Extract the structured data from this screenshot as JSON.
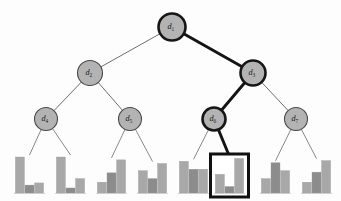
{
  "figure": {
    "type": "hierarchical-tree-with-leaf-histograms",
    "background_color": "#fdfdfd",
    "node_fill_color": "#b3b3b3",
    "node_stroke_color": "#4a4a4a",
    "highlight_color": "#141414",
    "bar_color": "#a8a8a8",
    "bar_color_dark": "#8c8c8c",
    "highlight_path": [
      "d1",
      "d3",
      "d6",
      "histogram-6"
    ]
  },
  "nodes": [
    {
      "id": "d1",
      "label": "d",
      "subscript": "1",
      "cx": 172,
      "cy": 27,
      "r": 13.5,
      "highlighted": true,
      "level": 0
    },
    {
      "id": "d2",
      "label": "d",
      "subscript": "2",
      "cx": 90,
      "cy": 73,
      "r": 12.5,
      "highlighted": false,
      "level": 1
    },
    {
      "id": "d3",
      "label": "d",
      "subscript": "3",
      "cx": 253,
      "cy": 73,
      "r": 12.5,
      "highlighted": true,
      "level": 1
    },
    {
      "id": "d4",
      "label": "d",
      "subscript": "4",
      "cx": 46,
      "cy": 119,
      "r": 11.5,
      "highlighted": false,
      "level": 2
    },
    {
      "id": "d5",
      "label": "d",
      "subscript": "5",
      "cx": 130,
      "cy": 119,
      "r": 11.5,
      "highlighted": false,
      "level": 2
    },
    {
      "id": "d6",
      "label": "d",
      "subscript": "6",
      "cx": 214,
      "cy": 119,
      "r": 11.5,
      "highlighted": true,
      "level": 2
    },
    {
      "id": "d7",
      "label": "d",
      "subscript": "7",
      "cx": 296,
      "cy": 119,
      "r": 11.5,
      "highlighted": false,
      "level": 2
    }
  ],
  "edges": [
    {
      "id": "e-d1-d2",
      "from": "d1",
      "to": "d2",
      "highlighted": false
    },
    {
      "id": "e-d1-d3",
      "from": "d1",
      "to": "d3",
      "highlighted": true
    },
    {
      "id": "e-d2-d4",
      "from": "d2",
      "to": "d4",
      "highlighted": false
    },
    {
      "id": "e-d2-d5",
      "from": "d2",
      "to": "d5",
      "highlighted": false
    },
    {
      "id": "e-d3-d6",
      "from": "d3",
      "to": "d6",
      "highlighted": true
    },
    {
      "id": "e-d3-d7",
      "from": "d3",
      "to": "d7",
      "highlighted": false
    }
  ],
  "leaf_edges": [
    {
      "id": "le-d4-h1",
      "from": "d4",
      "to": "histogram-1",
      "highlighted": false
    },
    {
      "id": "le-d4-h2",
      "from": "d4",
      "to": "histogram-2",
      "highlighted": false
    },
    {
      "id": "le-d5-h3",
      "from": "d5",
      "to": "histogram-3",
      "highlighted": false
    },
    {
      "id": "le-d5-h4",
      "from": "d5",
      "to": "histogram-4",
      "highlighted": false
    },
    {
      "id": "le-d6-h5",
      "from": "d6",
      "to": "histogram-5",
      "highlighted": false
    },
    {
      "id": "le-d6-h6",
      "from": "d6",
      "to": "histogram-6",
      "highlighted": true
    },
    {
      "id": "le-d7-h7",
      "from": "d7",
      "to": "histogram-7",
      "highlighted": false
    },
    {
      "id": "le-d7-h8",
      "from": "d7",
      "to": "histogram-8",
      "highlighted": false
    }
  ],
  "chart_data": {
    "type": "bar",
    "title": "",
    "xlabel": "",
    "ylabel": "",
    "ylim": [
      0,
      1
    ],
    "grid": false,
    "legend": null,
    "categories": [
      "b1",
      "b2",
      "b3"
    ],
    "charts": [
      {
        "id": "histogram-1",
        "parent": "d4",
        "x": 16,
        "values": [
          1.0,
          0.22,
          0.28
        ],
        "boxed": false
      },
      {
        "id": "histogram-2",
        "parent": "d4",
        "x": 57,
        "values": [
          1.0,
          0.14,
          0.4
        ],
        "boxed": false
      },
      {
        "id": "histogram-3",
        "parent": "d5",
        "x": 98,
        "values": [
          0.3,
          0.56,
          0.92
        ],
        "boxed": false
      },
      {
        "id": "histogram-4",
        "parent": "d5",
        "x": 139,
        "values": [
          0.62,
          0.4,
          0.82
        ],
        "boxed": false
      },
      {
        "id": "histogram-5",
        "parent": "d6",
        "x": 180,
        "values": [
          0.88,
          0.66,
          0.66
        ],
        "boxed": false
      },
      {
        "id": "histogram-6",
        "parent": "d6",
        "x": 216,
        "values": [
          0.52,
          0.18,
          0.96
        ],
        "boxed": true
      },
      {
        "id": "histogram-7",
        "parent": "d7",
        "x": 262,
        "values": [
          0.4,
          0.84,
          0.62
        ],
        "boxed": false
      },
      {
        "id": "histogram-8",
        "parent": "d7",
        "x": 303,
        "values": [
          0.3,
          0.58,
          0.9
        ],
        "boxed": false
      }
    ]
  }
}
